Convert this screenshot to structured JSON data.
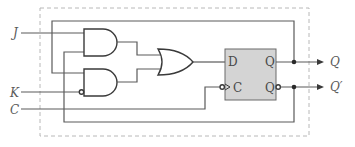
{
  "diagram": {
    "type": "logic-circuit",
    "inputs": [
      {
        "label": "J",
        "name": "input-j"
      },
      {
        "label": "K",
        "name": "input-k"
      },
      {
        "label": "C",
        "name": "input-c"
      }
    ],
    "outputs": [
      {
        "label": "Q",
        "name": "output-q"
      },
      {
        "label": "Q′",
        "name": "output-q-prime"
      }
    ],
    "flip_flop": {
      "type": "D",
      "pins": {
        "d": "D",
        "c": "C",
        "q": "Q",
        "qn": "Q"
      }
    },
    "gates": [
      {
        "type": "AND",
        "inputs": [
          "J",
          "Q′"
        ]
      },
      {
        "type": "AND",
        "inputs": [
          "Q",
          "K′"
        ]
      },
      {
        "type": "OR",
        "inputs": [
          "AND1",
          "AND2"
        ],
        "output": "D"
      }
    ],
    "colors": {
      "wire": "#5a5a5a",
      "gate_stroke": "#3a3a3a",
      "flipflop_fill": "#d4d4d4",
      "boundary": "#b8b8b8"
    }
  }
}
